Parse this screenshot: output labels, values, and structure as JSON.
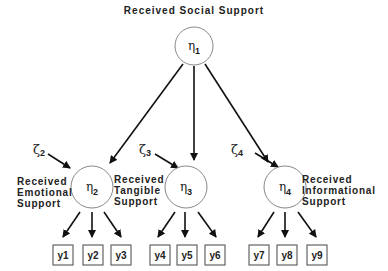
{
  "diagram": {
    "title": "Received Social Support",
    "latent_factors": [
      {
        "id": "eta1",
        "symbol": "η",
        "sub": "1",
        "label": ""
      },
      {
        "id": "eta2",
        "symbol": "η",
        "sub": "2",
        "label_lines": [
          "Received",
          "Emotional",
          "Support"
        ]
      },
      {
        "id": "eta3",
        "symbol": "η",
        "sub": "3",
        "label_lines": [
          "Received",
          "Tangible",
          "Support"
        ]
      },
      {
        "id": "eta4",
        "symbol": "η",
        "sub": "4",
        "label_lines": [
          "Received",
          "Informational",
          "Support"
        ]
      }
    ],
    "disturbances": [
      {
        "symbol": "ζ",
        "sub": "2"
      },
      {
        "symbol": "ζ",
        "sub": "3"
      },
      {
        "symbol": "ζ",
        "sub": "4"
      }
    ],
    "indicators": [
      "y1",
      "y2",
      "y3",
      "y4",
      "y5",
      "y6",
      "y7",
      "y8",
      "y9"
    ],
    "edges": [
      [
        "eta1",
        "eta2"
      ],
      [
        "eta1",
        "eta3"
      ],
      [
        "eta1",
        "eta4"
      ],
      [
        "zeta2",
        "eta2"
      ],
      [
        "zeta3",
        "eta3"
      ],
      [
        "zeta4",
        "eta4"
      ],
      [
        "eta2",
        "y1"
      ],
      [
        "eta2",
        "y2"
      ],
      [
        "eta2",
        "y3"
      ],
      [
        "eta3",
        "y4"
      ],
      [
        "eta3",
        "y5"
      ],
      [
        "eta3",
        "y6"
      ],
      [
        "eta4",
        "y7"
      ],
      [
        "eta4",
        "y8"
      ],
      [
        "eta4",
        "y9"
      ]
    ]
  }
}
